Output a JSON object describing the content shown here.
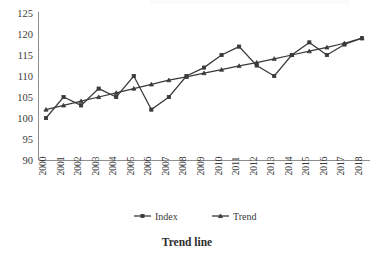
{
  "chart_data": {
    "type": "line",
    "title": "Trend line",
    "xlabel": "",
    "ylabel": "",
    "ylim": [
      90,
      125
    ],
    "ytick_step": 5,
    "yticks": [
      90,
      95,
      100,
      105,
      110,
      115,
      120,
      125
    ],
    "grid": false,
    "legend_position": "bottom",
    "categories": [
      "2000",
      "2001",
      "2002",
      "2003",
      "2004",
      "2005",
      "2006",
      "2007",
      "2008",
      "2009",
      "2010",
      "2011",
      "2012",
      "2013",
      "2014",
      "2015",
      "2016",
      "2017",
      "2018"
    ],
    "series": [
      {
        "name": "Index",
        "marker": "square",
        "color": "#3a3a3a",
        "values": [
          100,
          105,
          103,
          107,
          105,
          110,
          102,
          105,
          110,
          112,
          115,
          117,
          112.5,
          110,
          115,
          118,
          115,
          117.5,
          119
        ]
      },
      {
        "name": "Trend",
        "marker": "triangle",
        "color": "#3a3a3a",
        "values": [
          102,
          103,
          104,
          105,
          106,
          107,
          108,
          109,
          109.8,
          110.7,
          111.5,
          112.4,
          113.2,
          114.1,
          115,
          115.9,
          116.8,
          117.8,
          119
        ]
      }
    ]
  },
  "legend": {
    "items": [
      {
        "label": "Index"
      },
      {
        "label": "Trend"
      }
    ]
  },
  "axis": {
    "y_labels": [
      "125",
      "120",
      "115",
      "110",
      "105",
      "100",
      "95",
      "90"
    ],
    "x_labels": [
      "2000",
      "2001",
      "2002",
      "2003",
      "2004",
      "2005",
      "2006",
      "2007",
      "2008",
      "2009",
      "2010",
      "2011",
      "2012",
      "2013",
      "2014",
      "2015",
      "2016",
      "2017",
      "2018"
    ]
  },
  "colors": {
    "series": "#3a3a3a",
    "axis": "#8e8e8e",
    "text": "#3a3a3a",
    "title": "#2e2e2e",
    "background": "#ffffff"
  }
}
